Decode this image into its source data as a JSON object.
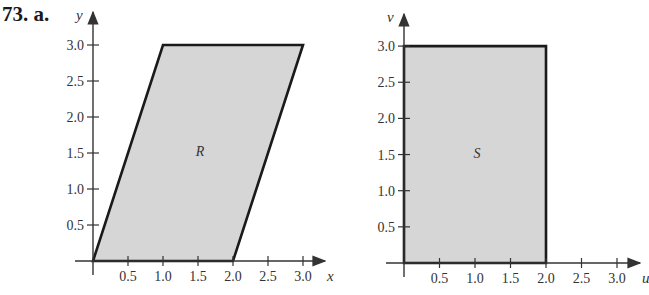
{
  "problem_label": "73. a.",
  "chart_data": [
    {
      "type": "area",
      "title": "",
      "region_label": "R",
      "xlabel": "x",
      "ylabel": "y",
      "xlim": [
        0,
        3.0
      ],
      "ylim": [
        0,
        3.0
      ],
      "x_ticks": [
        "0.5",
        "1.0",
        "1.5",
        "2.0",
        "2.5",
        "3.0"
      ],
      "y_ticks": [
        "0.5",
        "1.0",
        "1.5",
        "2.0",
        "2.5",
        "3.0"
      ],
      "grid": false,
      "shape": "parallelogram",
      "vertices": [
        [
          0,
          0
        ],
        [
          1,
          3
        ],
        [
          3,
          3
        ],
        [
          2,
          0
        ]
      ]
    },
    {
      "type": "area",
      "title": "",
      "region_label": "S",
      "xlabel": "u",
      "ylabel": "v",
      "xlim": [
        0,
        3.0
      ],
      "ylim": [
        0,
        3.0
      ],
      "x_ticks": [
        "0.5",
        "1.0",
        "1.5",
        "2.0",
        "2.5",
        "3.0"
      ],
      "y_ticks": [
        "0.5",
        "1.0",
        "1.5",
        "2.0",
        "2.5",
        "3.0"
      ],
      "grid": false,
      "shape": "rectangle",
      "vertices": [
        [
          0,
          0
        ],
        [
          0,
          3
        ],
        [
          2,
          3
        ],
        [
          2,
          0
        ]
      ]
    }
  ],
  "colors": {
    "fill": "#d6d6d6",
    "stroke": "#1a1a1a",
    "axis": "#333333"
  }
}
